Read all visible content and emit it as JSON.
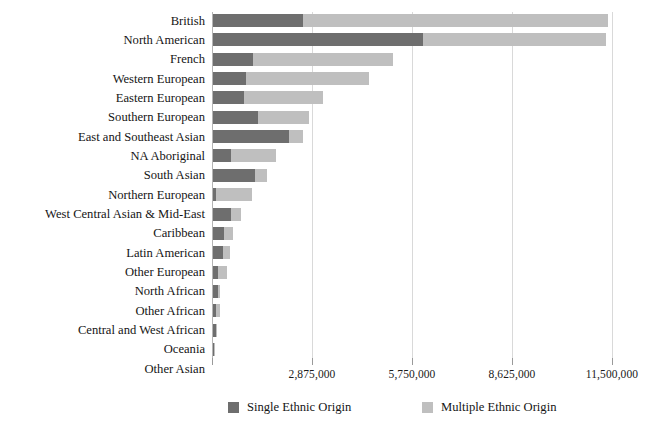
{
  "chart_data": {
    "type": "bar",
    "orientation": "horizontal",
    "stacked": true,
    "title": "",
    "subtitle": "",
    "xlabel": "",
    "ylabel": "",
    "xlim": [
      0,
      11500000
    ],
    "grid": true,
    "legend_position": "bottom",
    "xticks": [
      0,
      2875000,
      5750000,
      8625000,
      11500000
    ],
    "xtick_labels": [
      "",
      "2,875,000",
      "5,750,000",
      "8,625,000",
      "11,500,000"
    ],
    "categories": [
      "British",
      "North American",
      "French",
      "Western European",
      "Eastern European",
      "Southern European",
      "East and Southeast Asian",
      "NA Aboriginal",
      "South Asian",
      "Northern European",
      "West Central Asian & Mid-East",
      "Caribbean",
      "Latin American",
      "Other European",
      "North African",
      "Other African",
      "Central and West African",
      "Oceania",
      "Other Asian"
    ],
    "series": [
      {
        "name": "Single Ethnic Origin",
        "color": "#6e6e6e",
        "values": [
          2590000,
          6040000,
          1150000,
          950000,
          890000,
          1290000,
          2180000,
          520000,
          1210000,
          90000,
          520000,
          320000,
          290000,
          150000,
          150000,
          90000,
          90000,
          30000,
          0
        ]
      },
      {
        "name": "Multiple Ethnic Origin",
        "color": "#bfbfbf",
        "values": [
          8760000,
          5260000,
          4030000,
          3540000,
          2270000,
          1470000,
          410000,
          1290000,
          340000,
          1030000,
          290000,
          260000,
          200000,
          260000,
          60000,
          110000,
          30000,
          30000,
          0
        ]
      }
    ],
    "totals": [
      11350000,
      11300000,
      5180000,
      4490000,
      3160000,
      2760000,
      2590000,
      1810000,
      1550000,
      1120000,
      810000,
      580000,
      490000,
      410000,
      210000,
      200000,
      120000,
      60000,
      0
    ]
  },
  "legend": {
    "items": [
      {
        "label": "Single Ethnic Origin",
        "color": "#6e6e6e"
      },
      {
        "label": "Multiple Ethnic Origin",
        "color": "#bfbfbf"
      }
    ]
  }
}
